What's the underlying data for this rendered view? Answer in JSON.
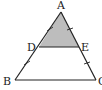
{
  "diagram": {
    "type": "geometry-triangle",
    "points": {
      "A": {
        "label": "A",
        "x": 61,
        "y": 12
      },
      "B": {
        "label": "B",
        "x": 15,
        "y": 80
      },
      "C": {
        "label": "C",
        "x": 96,
        "y": 80
      },
      "D": {
        "label": "D",
        "x": 39,
        "y": 47
      },
      "E": {
        "label": "E",
        "x": 79,
        "y": 47
      }
    },
    "segments": [
      "AB",
      "AC",
      "BC",
      "DE"
    ],
    "shaded_region": "ADE",
    "shade_color": "#bdbdbd",
    "line_color": "#222222",
    "tick_marks": [
      "AD",
      "DB",
      "AE",
      "EC"
    ]
  }
}
